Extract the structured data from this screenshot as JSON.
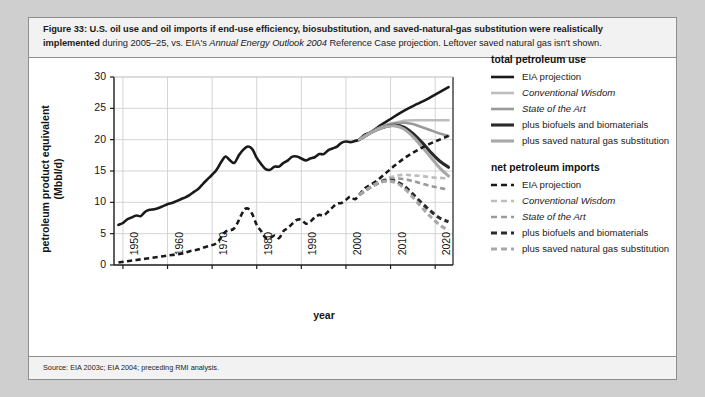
{
  "figure": {
    "number": "Figure 33:",
    "caption_bold": "Figure 33: U.S. oil use and oil imports if end-use efficiency, biosubstitution, and saved-natural-gas substitution were realistically implemented",
    "caption_rest_1": " during 2005–25, vs. EIA's ",
    "caption_italic": "Annual Energy Outlook 2004",
    "caption_rest_2": " Reference Case projection. Leftover saved natural gas isn't shown.",
    "source": "Source: EIA 2003c; EIA 2004; preceding RMI analysis."
  },
  "legend": {
    "group_1_title": "total petroleum use",
    "group_2_title": "net petroleum imports",
    "items_total": [
      {
        "label": "EIA projection",
        "style": "solid",
        "color": "#1a1a1a",
        "width": 2.6,
        "italic": false
      },
      {
        "label": "Conventional Wisdom",
        "style": "solid",
        "color": "#bdbdbd",
        "width": 2.6,
        "italic": true
      },
      {
        "label": "State of the Art",
        "style": "solid",
        "color": "#9a9a9a",
        "width": 2.6,
        "italic": true
      },
      {
        "label": "plus biofuels and biomaterials",
        "style": "solid",
        "color": "#2b2b2b",
        "width": 3.1,
        "italic": false
      },
      {
        "label": "plus saved natural gas substitution",
        "style": "solid",
        "color": "#a8a8a8",
        "width": 3.1,
        "italic": false
      }
    ],
    "items_imports": [
      {
        "label": "EIA projection",
        "style": "dashed",
        "color": "#1a1a1a",
        "width": 2.6,
        "italic": false
      },
      {
        "label": "Conventional Wisdom",
        "style": "dashed",
        "color": "#bdbdbd",
        "width": 2.6,
        "italic": true
      },
      {
        "label": "State of the Art",
        "style": "dashed",
        "color": "#9a9a9a",
        "width": 2.6,
        "italic": true
      },
      {
        "label": "plus biofuels and biomaterials",
        "style": "dashed",
        "color": "#2b2b2b",
        "width": 3.1,
        "italic": false
      },
      {
        "label": "plus saved natural gas substitution",
        "style": "dashed",
        "color": "#a8a8a8",
        "width": 3.1,
        "italic": false
      }
    ]
  },
  "chart_data": {
    "type": "line",
    "title": "",
    "xlabel": "year",
    "ylabel": "petroleum product equivalent (Mbbl/d)",
    "xlim": [
      1948,
      2024
    ],
    "ylim": [
      0,
      30
    ],
    "xticks": [
      1950,
      1960,
      1970,
      1980,
      1990,
      2000,
      2010,
      2020
    ],
    "yticks": [
      0,
      5,
      10,
      15,
      20,
      25,
      30
    ],
    "grid": true,
    "legend_position": "right",
    "series": [
      {
        "name": "total petroleum use — history + EIA projection",
        "group": "total petroleum use",
        "style": "solid",
        "color": "#1a1a1a",
        "width": 2.6,
        "x": [
          1949,
          1950,
          1951,
          1952,
          1953,
          1954,
          1955,
          1956,
          1957,
          1958,
          1959,
          1960,
          1961,
          1962,
          1963,
          1964,
          1965,
          1966,
          1967,
          1968,
          1969,
          1970,
          1971,
          1972,
          1973,
          1974,
          1975,
          1976,
          1977,
          1978,
          1979,
          1980,
          1981,
          1982,
          1983,
          1984,
          1985,
          1986,
          1987,
          1988,
          1989,
          1990,
          1991,
          1992,
          1993,
          1994,
          1995,
          1996,
          1997,
          1998,
          1999,
          2000,
          2001,
          2002,
          2003,
          2004,
          2005,
          2006,
          2008,
          2010,
          2012,
          2014,
          2016,
          2018,
          2020,
          2022,
          2023
        ],
        "y": [
          6.4,
          6.7,
          7.3,
          7.6,
          7.9,
          7.8,
          8.5,
          8.8,
          8.9,
          9.1,
          9.4,
          9.7,
          9.9,
          10.2,
          10.5,
          10.8,
          11.2,
          11.7,
          12.2,
          13.0,
          13.7,
          14.4,
          15.2,
          16.4,
          17.3,
          16.7,
          16.3,
          17.5,
          18.4,
          18.9,
          18.5,
          17.1,
          16.1,
          15.3,
          15.2,
          15.7,
          15.7,
          16.3,
          16.7,
          17.3,
          17.3,
          17.0,
          16.7,
          17.0,
          17.2,
          17.7,
          17.7,
          18.3,
          18.6,
          18.9,
          19.5,
          19.7,
          19.6,
          19.8,
          20.0,
          20.7,
          21.0,
          21.4,
          22.4,
          23.3,
          24.2,
          25.0,
          25.7,
          26.4,
          27.2,
          28.0,
          28.4
        ]
      },
      {
        "name": "Conventional Wisdom — total use",
        "group": "total petroleum use",
        "style": "solid",
        "color": "#bdbdbd",
        "width": 2.6,
        "x": [
          2003,
          2005,
          2007,
          2009,
          2011,
          2013,
          2015,
          2017,
          2019,
          2021,
          2023
        ],
        "y": [
          20.0,
          20.9,
          21.7,
          22.3,
          22.7,
          23.0,
          23.1,
          23.1,
          23.1,
          23.1,
          23.1
        ]
      },
      {
        "name": "State of the Art — total use",
        "group": "total petroleum use",
        "style": "solid",
        "color": "#9a9a9a",
        "width": 2.6,
        "x": [
          2003,
          2005,
          2007,
          2009,
          2011,
          2013,
          2015,
          2017,
          2019,
          2021,
          2023
        ],
        "y": [
          20.0,
          20.9,
          21.7,
          22.3,
          22.6,
          22.7,
          22.5,
          22.0,
          21.5,
          21.0,
          20.6
        ]
      },
      {
        "name": "plus biofuels and biomaterials — total use",
        "group": "total petroleum use",
        "style": "solid",
        "color": "#2b2b2b",
        "width": 3.1,
        "x": [
          2003,
          2005,
          2007,
          2009,
          2011,
          2013,
          2015,
          2017,
          2019,
          2021,
          2023
        ],
        "y": [
          20.0,
          20.9,
          21.6,
          22.1,
          22.3,
          22.0,
          21.0,
          19.6,
          18.0,
          16.6,
          15.6
        ]
      },
      {
        "name": "plus saved natural gas substitution — total use",
        "group": "total petroleum use",
        "style": "solid",
        "color": "#a8a8a8",
        "width": 3.1,
        "x": [
          2003,
          2005,
          2007,
          2009,
          2011,
          2013,
          2015,
          2017,
          2019,
          2021,
          2023
        ],
        "y": [
          20.0,
          20.9,
          21.6,
          22.1,
          22.2,
          21.7,
          20.5,
          18.9,
          17.2,
          15.5,
          14.2
        ]
      },
      {
        "name": "net petroleum imports — history + EIA projection",
        "group": "net petroleum imports",
        "style": "dashed",
        "color": "#1a1a1a",
        "width": 2.6,
        "x": [
          1949,
          1951,
          1953,
          1955,
          1957,
          1959,
          1961,
          1963,
          1965,
          1967,
          1969,
          1971,
          1973,
          1975,
          1977,
          1978,
          1979,
          1980,
          1981,
          1982,
          1983,
          1984,
          1985,
          1986,
          1987,
          1988,
          1989,
          1990,
          1991,
          1992,
          1993,
          1994,
          1995,
          1996,
          1997,
          1998,
          1999,
          2000,
          2001,
          2002,
          2003,
          2004,
          2005,
          2007,
          2009,
          2011,
          2013,
          2015,
          2017,
          2019,
          2021,
          2023
        ],
        "y": [
          0.4,
          0.6,
          0.8,
          1.0,
          1.2,
          1.4,
          1.6,
          1.8,
          2.2,
          2.5,
          3.0,
          3.5,
          5.3,
          5.9,
          8.6,
          9.0,
          8.1,
          6.4,
          5.4,
          4.3,
          4.3,
          4.7,
          4.3,
          5.4,
          5.9,
          6.6,
          7.2,
          7.2,
          6.6,
          6.9,
          7.6,
          8.0,
          7.9,
          8.5,
          9.2,
          9.8,
          9.9,
          10.4,
          10.9,
          10.5,
          11.2,
          12.1,
          12.6,
          13.5,
          14.7,
          15.9,
          17.0,
          17.9,
          18.7,
          19.4,
          20.0,
          20.6
        ]
      },
      {
        "name": "Conventional Wisdom — net imports",
        "group": "net petroleum imports",
        "style": "dashed",
        "color": "#bdbdbd",
        "width": 2.6,
        "x": [
          2003,
          2005,
          2007,
          2009,
          2011,
          2013,
          2015,
          2017,
          2019,
          2021,
          2023
        ],
        "y": [
          11.2,
          12.2,
          13.1,
          13.8,
          14.2,
          14.4,
          14.3,
          14.2,
          14.0,
          13.9,
          13.8
        ]
      },
      {
        "name": "State of the Art — net imports",
        "group": "net petroleum imports",
        "style": "dashed",
        "color": "#9a9a9a",
        "width": 2.6,
        "x": [
          2003,
          2005,
          2007,
          2009,
          2011,
          2013,
          2015,
          2017,
          2019,
          2021,
          2023
        ],
        "y": [
          11.2,
          12.2,
          13.0,
          13.6,
          13.8,
          13.7,
          13.4,
          13.0,
          12.6,
          12.3,
          12.0
        ]
      },
      {
        "name": "plus biofuels and biomaterials — net imports",
        "group": "net petroleum imports",
        "style": "dashed",
        "color": "#2b2b2b",
        "width": 3.1,
        "x": [
          2003,
          2005,
          2007,
          2009,
          2011,
          2013,
          2015,
          2017,
          2019,
          2021,
          2023
        ],
        "y": [
          11.2,
          12.2,
          13.0,
          13.5,
          13.4,
          12.6,
          11.3,
          9.9,
          8.6,
          7.5,
          6.9
        ]
      },
      {
        "name": "plus saved natural gas substitution — net imports",
        "group": "net petroleum imports",
        "style": "dashed",
        "color": "#a8a8a8",
        "width": 3.1,
        "x": [
          2003,
          2005,
          2007,
          2009,
          2011,
          2013,
          2015,
          2017,
          2019,
          2021,
          2023
        ],
        "y": [
          11.2,
          12.2,
          13.0,
          13.4,
          13.2,
          12.3,
          10.8,
          9.2,
          7.7,
          6.4,
          5.5
        ]
      }
    ]
  }
}
